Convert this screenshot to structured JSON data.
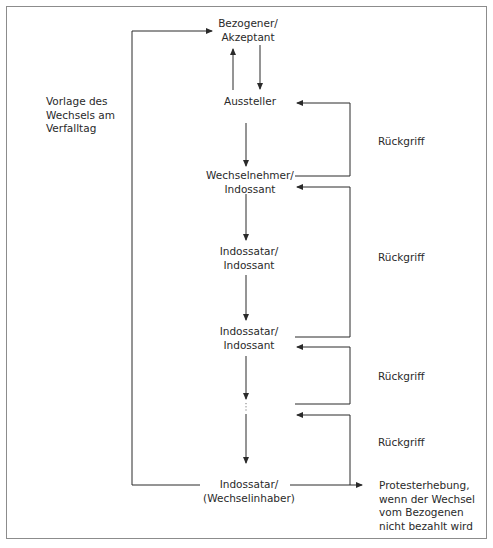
{
  "diagram": {
    "nodes": [
      {
        "id": "bezogener",
        "lines": [
          "Bezogener/",
          "Akzeptant"
        ]
      },
      {
        "id": "aussteller",
        "lines": [
          "Aussteller"
        ]
      },
      {
        "id": "wechselnehmer",
        "lines": [
          "Wechselnehmer/",
          "Indossant"
        ]
      },
      {
        "id": "indossatar1",
        "lines": [
          "Indossatar/",
          "Indossant"
        ]
      },
      {
        "id": "indossatar2",
        "lines": [
          "Indossatar/",
          "Indossant"
        ]
      },
      {
        "id": "ellipsis",
        "lines": [
          "⋮"
        ]
      },
      {
        "id": "inhaber",
        "lines": [
          "Indossatar/",
          "(Wechselinhaber)"
        ]
      }
    ],
    "left_label": {
      "lines": [
        "Vorlage des",
        "Wechsels am",
        "Verfalltag"
      ]
    },
    "recourse_labels": [
      "Rückgriff",
      "Rückgriff",
      "Rückgriff",
      "Rückgriff"
    ],
    "protest_label": {
      "lines": [
        "Protesterhebung,",
        "wenn der Wechsel",
        "vom Bezogenen",
        "nicht bezahlt wird"
      ]
    },
    "colors": {
      "line": "#2a2a2a",
      "frame": "#8c8c8c",
      "text": "#2a2a2a"
    }
  }
}
